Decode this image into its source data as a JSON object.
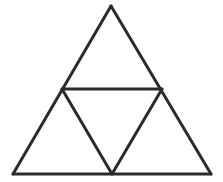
{
  "figure": {
    "background_color": "#ffffff",
    "stroke_color": "#2b2b2b",
    "stroke_width": 3,
    "canvas": {
      "width": 223,
      "height": 182
    },
    "points": {
      "apex": {
        "name": "apex",
        "x": 111,
        "y": 6
      },
      "bottom_left": {
        "name": "bottom-left",
        "x": 13,
        "y": 174
      },
      "bottom_right": {
        "name": "bottom-right",
        "x": 211,
        "y": 174
      },
      "mid_left": {
        "name": "left-midpoint",
        "x": 62,
        "y": 89
      },
      "mid_right": {
        "name": "right-midpoint",
        "x": 162,
        "y": 89
      },
      "base_mid": {
        "name": "base-midpoint",
        "x": 112,
        "y": 174
      }
    },
    "segments": [
      {
        "id": "outer-left-edge",
        "label": "Outer left edge",
        "x1": 111,
        "y1": 6,
        "x2": 13,
        "y2": 174
      },
      {
        "id": "outer-right-edge",
        "label": "Outer right edge",
        "x1": 111,
        "y1": 6,
        "x2": 211,
        "y2": 174
      },
      {
        "id": "base-edge",
        "label": "Base edge",
        "x1": 13,
        "y1": 174,
        "x2": 211,
        "y2": 174
      },
      {
        "id": "horizontal-midsegment",
        "label": "Horizontal midsegment",
        "x1": 62,
        "y1": 89,
        "x2": 162,
        "y2": 89
      },
      {
        "id": "diagonal-left",
        "label": "Left inner diagonal",
        "x1": 62,
        "y1": 89,
        "x2": 112,
        "y2": 174
      },
      {
        "id": "diagonal-right",
        "label": "Right inner diagonal",
        "x1": 162,
        "y1": 89,
        "x2": 112,
        "y2": 174
      }
    ],
    "regions": [
      {
        "id": "top-triangle",
        "label": "Top triangle",
        "points": "111,6 62,89 162,89"
      },
      {
        "id": "bottom-left-triangle",
        "label": "Bottom-left triangle",
        "points": "62,89 13,174 112,174"
      },
      {
        "id": "bottom-right-triangle",
        "label": "Bottom-right triangle",
        "points": "162,89 112,174 211,174"
      },
      {
        "id": "inverted-center-triangle",
        "label": "Inverted center triangle",
        "points": "62,89 162,89 112,174"
      }
    ],
    "counts": {
      "small_triangles": 4,
      "total_triangles_visible": 5,
      "vertices": 6,
      "segments": 6
    }
  }
}
